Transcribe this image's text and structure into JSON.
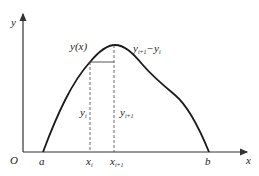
{
  "diagram": {
    "type": "function-curve-discretization",
    "colors": {
      "curve": "#1a1a1a",
      "axis": "#333333",
      "dashed": "#444444",
      "text": "#222222",
      "background": "#ffffff"
    },
    "axes": {
      "x_label": "x",
      "y_label": "y",
      "origin_label": "O"
    },
    "curve": {
      "label": "y(x)"
    },
    "points": {
      "a": "a",
      "b": "b",
      "xi": {
        "base": "x",
        "sub": "i"
      },
      "xi1": {
        "base": "x",
        "sub": "i+1"
      }
    },
    "ordinates": {
      "yi": {
        "base": "y",
        "sub": "i"
      },
      "yi1": {
        "base": "y",
        "sub": "i+1"
      }
    },
    "difference": {
      "base1": "y",
      "sub1": "i+1",
      "op": "−",
      "base2": "y",
      "sub2": "i"
    }
  }
}
